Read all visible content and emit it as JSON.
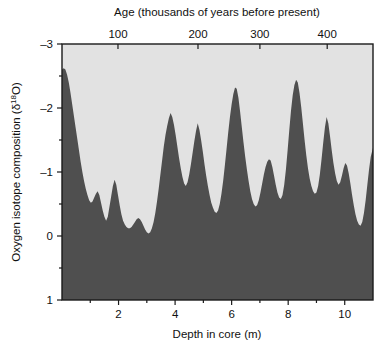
{
  "figure": {
    "background_color": "#ffffff",
    "plot_fill_color": "#e2e2e2",
    "series_fill_color": "#4f4f4f",
    "axis_color": "#1a1a1a"
  },
  "chart_data": {
    "type": "area",
    "title": "",
    "subtitle": "",
    "xlabel": "Depth in core (m)",
    "ylabel": "Oxygen isotope composition (δ¹⁸O)",
    "top_axis_label": "Age (thousands of years before present)",
    "ylabel_parts": {
      "prefix": "Oxygen isotope composition (δ",
      "superscript": "18",
      "suffix": "O)"
    },
    "grid": false,
    "legend": "none",
    "y_inverted": true,
    "ylim": [
      -3,
      1
    ],
    "yticks": [
      -3,
      -2,
      -1,
      0,
      1
    ],
    "ytick_labels": [
      "–3",
      "–2",
      "–1",
      "0",
      "1"
    ],
    "yminor_ticks": [
      -2.5,
      -1.5,
      -0.5,
      0.5
    ],
    "xlim": [
      0,
      11
    ],
    "xticks": [
      2,
      4,
      6,
      8,
      10
    ],
    "xtick_labels": [
      "2",
      "4",
      "6",
      "8",
      "10"
    ],
    "xminor_ticks": [
      1,
      3,
      5,
      7,
      9
    ],
    "top_axis": {
      "label": "Age (thousands of years before present)",
      "ticks": [
        100,
        200,
        300,
        400
      ],
      "tick_labels": [
        "100",
        "200",
        "300",
        "400"
      ],
      "tick_depth_positions": [
        1.98,
        4.81,
        7.0,
        9.38
      ]
    },
    "x_unit": "m",
    "y_unit": "per mil",
    "series": [
      {
        "name": "Oxygen isotope composition",
        "x": [
          0.0,
          0.06,
          0.12,
          0.18,
          0.24,
          0.3,
          0.36,
          0.42,
          0.48,
          0.54,
          0.6,
          0.66,
          0.72,
          0.78,
          0.84,
          0.9,
          0.96,
          1.02,
          1.08,
          1.14,
          1.2,
          1.26,
          1.32,
          1.38,
          1.44,
          1.5,
          1.56,
          1.62,
          1.68,
          1.74,
          1.8,
          1.86,
          1.92,
          1.98,
          2.04,
          2.1,
          2.16,
          2.22,
          2.28,
          2.34,
          2.4,
          2.46,
          2.52,
          2.58,
          2.64,
          2.7,
          2.76,
          2.82,
          2.88,
          2.94,
          3.0,
          3.06,
          3.12,
          3.18,
          3.24,
          3.3,
          3.36,
          3.42,
          3.48,
          3.54,
          3.6,
          3.66,
          3.72,
          3.78,
          3.84,
          3.9,
          3.96,
          4.02,
          4.08,
          4.14,
          4.2,
          4.26,
          4.32,
          4.38,
          4.44,
          4.5,
          4.56,
          4.62,
          4.68,
          4.74,
          4.8,
          4.86,
          4.92,
          4.98,
          5.04,
          5.1,
          5.16,
          5.22,
          5.28,
          5.34,
          5.4,
          5.46,
          5.52,
          5.58,
          5.64,
          5.7,
          5.76,
          5.82,
          5.88,
          5.94,
          6.0,
          6.06,
          6.12,
          6.18,
          6.24,
          6.3,
          6.36,
          6.42,
          6.48,
          6.54,
          6.6,
          6.66,
          6.72,
          6.78,
          6.84,
          6.9,
          6.96,
          7.02,
          7.08,
          7.14,
          7.2,
          7.26,
          7.32,
          7.38,
          7.44,
          7.5,
          7.56,
          7.62,
          7.68,
          7.74,
          7.8,
          7.86,
          7.92,
          7.98,
          8.04,
          8.1,
          8.16,
          8.22,
          8.28,
          8.34,
          8.4,
          8.46,
          8.52,
          8.58,
          8.64,
          8.7,
          8.76,
          8.82,
          8.88,
          8.94,
          9.0,
          9.06,
          9.12,
          9.18,
          9.24,
          9.3,
          9.36,
          9.42,
          9.48,
          9.54,
          9.6,
          9.66,
          9.72,
          9.78,
          9.84,
          9.9,
          9.96,
          10.02,
          10.08,
          10.14,
          10.2,
          10.26,
          10.32,
          10.38,
          10.44,
          10.5,
          10.56,
          10.62,
          10.68,
          10.74,
          10.8,
          10.86,
          10.92,
          11.0
        ],
        "y": [
          -2.6,
          -2.62,
          -2.6,
          -2.52,
          -2.4,
          -2.24,
          -2.06,
          -1.88,
          -1.7,
          -1.52,
          -1.34,
          -1.16,
          -1.0,
          -0.86,
          -0.74,
          -0.64,
          -0.56,
          -0.52,
          -0.54,
          -0.6,
          -0.66,
          -0.7,
          -0.64,
          -0.52,
          -0.4,
          -0.3,
          -0.24,
          -0.3,
          -0.46,
          -0.62,
          -0.78,
          -0.88,
          -0.8,
          -0.64,
          -0.48,
          -0.34,
          -0.24,
          -0.18,
          -0.14,
          -0.12,
          -0.12,
          -0.14,
          -0.18,
          -0.22,
          -0.26,
          -0.28,
          -0.26,
          -0.22,
          -0.16,
          -0.1,
          -0.06,
          -0.04,
          -0.06,
          -0.12,
          -0.22,
          -0.36,
          -0.54,
          -0.74,
          -0.96,
          -1.18,
          -1.4,
          -1.58,
          -1.72,
          -1.84,
          -1.92,
          -1.86,
          -1.74,
          -1.58,
          -1.4,
          -1.22,
          -1.06,
          -0.92,
          -0.82,
          -0.78,
          -0.84,
          -0.96,
          -1.12,
          -1.3,
          -1.48,
          -1.64,
          -1.76,
          -1.66,
          -1.5,
          -1.32,
          -1.12,
          -0.94,
          -0.78,
          -0.64,
          -0.52,
          -0.44,
          -0.38,
          -0.36,
          -0.4,
          -0.5,
          -0.66,
          -0.86,
          -1.1,
          -1.36,
          -1.62,
          -1.86,
          -2.06,
          -2.22,
          -2.32,
          -2.3,
          -2.16,
          -1.94,
          -1.7,
          -1.46,
          -1.24,
          -1.04,
          -0.86,
          -0.7,
          -0.58,
          -0.5,
          -0.46,
          -0.48,
          -0.56,
          -0.68,
          -0.82,
          -0.96,
          -1.08,
          -1.16,
          -1.2,
          -1.18,
          -1.08,
          -0.94,
          -0.8,
          -0.68,
          -0.6,
          -0.58,
          -0.64,
          -0.8,
          -1.04,
          -1.34,
          -1.66,
          -1.96,
          -2.2,
          -2.36,
          -2.44,
          -2.4,
          -2.24,
          -2.02,
          -1.76,
          -1.5,
          -1.26,
          -1.06,
          -0.9,
          -0.78,
          -0.7,
          -0.66,
          -0.68,
          -0.78,
          -0.96,
          -1.2,
          -1.46,
          -1.7,
          -1.86,
          -1.76,
          -1.56,
          -1.34,
          -1.14,
          -0.98,
          -0.86,
          -0.8,
          -0.84,
          -0.94,
          -1.06,
          -1.14,
          -1.1,
          -0.98,
          -0.82,
          -0.64,
          -0.48,
          -0.34,
          -0.24,
          -0.18,
          -0.16,
          -0.22,
          -0.36,
          -0.56,
          -0.8,
          -1.04,
          -1.24,
          -1.38
        ]
      }
    ]
  },
  "plot_geometry": {
    "left": 62,
    "right": 373,
    "top": 44,
    "bottom": 300
  }
}
